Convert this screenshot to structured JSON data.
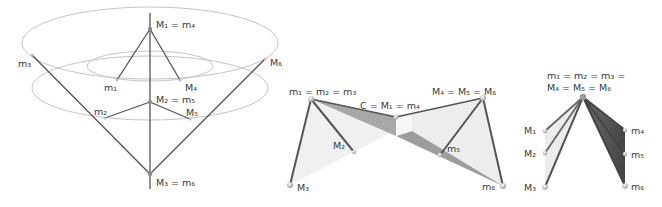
{
  "figures": [
    {
      "id": "cone-configuration",
      "labels": {
        "top": "M₁ = m₄",
        "m1": "m₁",
        "M4": "M₄",
        "m3": "m₃",
        "M6": "M₆",
        "mid": "M₂ = m₅",
        "m2": "m₂",
        "M5": "M₅",
        "bottom": "M₃ = m₆"
      }
    },
    {
      "id": "bowtie-configuration",
      "labels": {
        "left_apex": "m₁ = m₂ = m₃",
        "right_apex": "M₄ = M₅ = M₆",
        "center": "C = M₁ = m₄",
        "M2": "M₂",
        "m5": "m₅",
        "M3": "M₃",
        "m6": "m₆"
      }
    },
    {
      "id": "fan-configuration",
      "labels": {
        "apex_line1": "m₁ = m₂ = m₃ =",
        "apex_line2": "M₄ = M₅ = M₆",
        "M1": "M₁",
        "M2": "M₂",
        "M3": "M₃",
        "m4": "m₄",
        "m5": "m₅",
        "m6": "m₆"
      }
    }
  ],
  "colors": {
    "line": "#555555",
    "ellipse": "#bdbdbd",
    "light_face": "#ececec",
    "mid_face": "#a9a9a9",
    "dark_face": "#5a5a5a",
    "joint": "#d9d9d9"
  }
}
